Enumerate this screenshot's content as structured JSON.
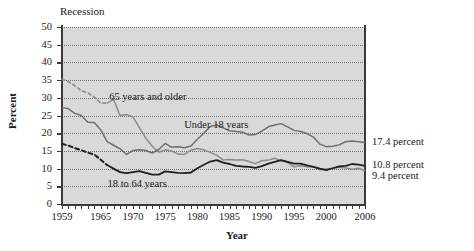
{
  "chart_data": {
    "type": "line",
    "title": "",
    "xlabel": "Year",
    "ylabel": "Percent",
    "ylim": [
      0,
      50
    ],
    "xlim": [
      1959,
      2006
    ],
    "ytick_labels": [
      "0",
      "5",
      "10",
      "15",
      "20",
      "25",
      "30",
      "35",
      "40",
      "45",
      "50"
    ],
    "ytick_values": [
      0,
      5,
      10,
      15,
      20,
      25,
      30,
      35,
      40,
      45,
      50
    ],
    "xtick_labels": [
      "1959",
      "1965",
      "1970",
      "1975",
      "1980",
      "1985",
      "1990",
      "1995",
      "2000",
      "2006"
    ],
    "xtick_values": [
      1959,
      1965,
      1970,
      1975,
      1980,
      1985,
      1990,
      1995,
      2000,
      2006
    ],
    "grid": true,
    "legend_position": "inline-annotations",
    "plot_background": "#d9d9d9",
    "recession_label": "Recession",
    "series": [
      {
        "name": "65 years and older",
        "color": "#8c8c8c",
        "label_x": 1966,
        "label_y": 30,
        "end_label": "9.4 percent",
        "end_value": 9.4,
        "dashed_until": 1966,
        "x": [
          1959,
          1960,
          1961,
          1962,
          1963,
          1964,
          1965,
          1966,
          1967,
          1968,
          1969,
          1970,
          1971,
          1972,
          1973,
          1974,
          1975,
          1976,
          1977,
          1978,
          1979,
          1980,
          1981,
          1982,
          1983,
          1984,
          1985,
          1986,
          1987,
          1988,
          1989,
          1990,
          1991,
          1992,
          1993,
          1994,
          1995,
          1996,
          1997,
          1998,
          1999,
          2000,
          2001,
          2002,
          2003,
          2004,
          2005,
          2006
        ],
        "values": [
          35.2,
          34.6,
          33.4,
          32.0,
          31.4,
          30.2,
          28.5,
          28.5,
          29.5,
          25.0,
          25.3,
          24.6,
          21.6,
          18.6,
          16.3,
          14.6,
          15.3,
          15.0,
          14.1,
          14.0,
          15.2,
          15.7,
          15.3,
          14.6,
          13.8,
          12.4,
          12.6,
          12.4,
          12.5,
          12.0,
          11.4,
          12.2,
          12.4,
          12.9,
          12.2,
          11.7,
          10.5,
          10.8,
          10.5,
          10.5,
          9.7,
          9.9,
          10.1,
          10.4,
          10.2,
          9.8,
          10.1,
          9.4
        ]
      },
      {
        "name": "Under 18 years",
        "color": "#6e6e6e",
        "label_x": 1982,
        "label_y": 22,
        "end_label": "17.4 percent",
        "end_value": 17.4,
        "x": [
          1959,
          1960,
          1961,
          1962,
          1963,
          1964,
          1965,
          1966,
          1967,
          1968,
          1969,
          1970,
          1971,
          1972,
          1973,
          1974,
          1975,
          1976,
          1977,
          1978,
          1979,
          1980,
          1981,
          1982,
          1983,
          1984,
          1985,
          1986,
          1987,
          1988,
          1989,
          1990,
          1991,
          1992,
          1993,
          1994,
          1995,
          1996,
          1997,
          1998,
          1999,
          2000,
          2001,
          2002,
          2003,
          2004,
          2005,
          2006
        ],
        "values": [
          27.3,
          26.9,
          25.6,
          25.0,
          23.1,
          23.0,
          21.0,
          17.6,
          16.6,
          15.6,
          14.0,
          15.1,
          15.3,
          15.1,
          14.4,
          15.4,
          17.1,
          16.0,
          16.2,
          15.9,
          16.4,
          18.3,
          20.0,
          21.9,
          22.3,
          21.5,
          20.7,
          20.5,
          20.3,
          19.5,
          19.6,
          20.6,
          21.8,
          22.3,
          22.7,
          21.8,
          20.8,
          20.5,
          19.9,
          18.9,
          16.9,
          16.2,
          16.3,
          16.7,
          17.6,
          17.8,
          17.6,
          17.4
        ]
      },
      {
        "name": "18 to 64 years",
        "color": "#1f1f1f",
        "label_x": 1967,
        "label_y": 5.6,
        "end_label": "10.8 percent",
        "end_value": 10.8,
        "dashed_until": 1966,
        "x": [
          1959,
          1960,
          1961,
          1962,
          1963,
          1964,
          1965,
          1966,
          1967,
          1968,
          1969,
          1970,
          1971,
          1972,
          1973,
          1974,
          1975,
          1976,
          1977,
          1978,
          1979,
          1980,
          1981,
          1982,
          1983,
          1984,
          1985,
          1986,
          1987,
          1988,
          1989,
          1990,
          1991,
          1992,
          1993,
          1994,
          1995,
          1996,
          1997,
          1998,
          1999,
          2000,
          2001,
          2002,
          2003,
          2004,
          2005,
          2006
        ],
        "values": [
          17.0,
          16.5,
          15.8,
          15.2,
          14.5,
          14.0,
          12.5,
          11.0,
          10.0,
          9.0,
          8.7,
          9.0,
          9.3,
          8.8,
          8.3,
          8.3,
          9.2,
          9.0,
          8.8,
          8.7,
          8.9,
          10.1,
          11.1,
          12.0,
          12.4,
          11.7,
          11.3,
          10.8,
          10.6,
          10.5,
          10.2,
          10.7,
          11.4,
          11.9,
          12.4,
          11.9,
          11.4,
          11.4,
          10.9,
          10.5,
          10.0,
          9.6,
          10.1,
          10.6,
          10.8,
          11.3,
          11.1,
          10.8
        ]
      }
    ],
    "annotations": [
      {
        "text": "Recession",
        "kind": "plot-note"
      },
      {
        "text": "65 years and older",
        "kind": "series-label"
      },
      {
        "text": "Under 18 years",
        "kind": "series-label"
      },
      {
        "text": "18 to 64 years",
        "kind": "series-label"
      },
      {
        "text": "17.4 percent",
        "kind": "end-value"
      },
      {
        "text": "10.8 percent",
        "kind": "end-value"
      },
      {
        "text": "9.4 percent",
        "kind": "end-value"
      }
    ]
  }
}
